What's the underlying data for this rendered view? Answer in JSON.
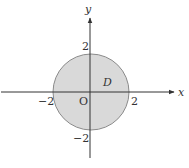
{
  "diagram": {
    "type": "disk-region",
    "region_label": "D",
    "origin_label": "O",
    "x_axis_label": "x",
    "y_axis_label": "y",
    "ticks": {
      "x_neg": "−2",
      "x_pos": "2",
      "y_pos": "2",
      "y_neg": "−2"
    },
    "circle": {
      "center": [
        0,
        0
      ],
      "radius": 2,
      "fill": "#d9d9d9",
      "stroke": "#8a8a8a"
    },
    "axis_color": "#333333"
  }
}
